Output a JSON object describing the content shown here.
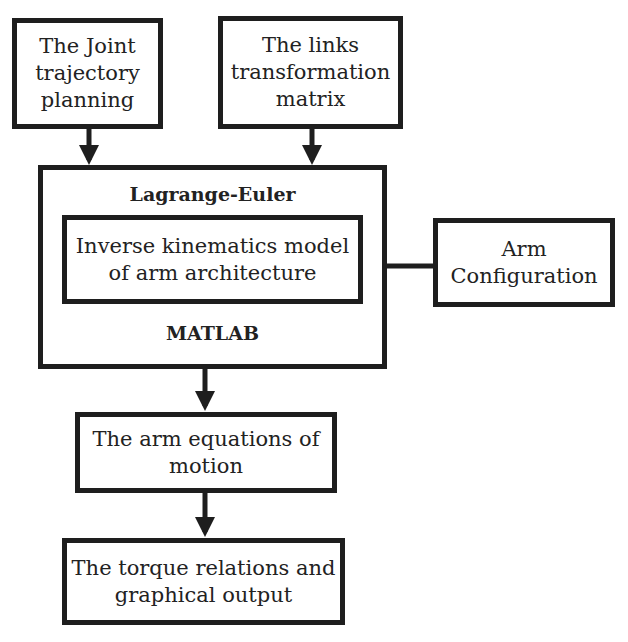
{
  "diagram": {
    "nodes": {
      "joint_trajectory": {
        "lines": [
          "The Joint",
          "trajectory",
          "planning"
        ]
      },
      "links_transformation": {
        "lines": [
          "The links",
          "transformation",
          "matrix"
        ]
      },
      "lagrange_euler": {
        "title": "Lagrange-Euler",
        "footer": "MATLAB"
      },
      "inverse_kinematics": {
        "lines": [
          "Inverse kinematics model",
          "of arm architecture"
        ]
      },
      "arm_configuration": {
        "lines": [
          "Arm",
          "Configuration"
        ]
      },
      "equations_of_motion": {
        "lines": [
          "The arm equations of",
          "motion"
        ]
      },
      "torque_relations": {
        "lines": [
          "The torque relations and",
          "graphical output"
        ]
      }
    },
    "edges": [
      {
        "from": "joint_trajectory",
        "to": "lagrange_euler"
      },
      {
        "from": "links_transformation",
        "to": "lagrange_euler"
      },
      {
        "from": "arm_configuration",
        "to": "inverse_kinematics"
      },
      {
        "from": "lagrange_euler",
        "to": "equations_of_motion"
      },
      {
        "from": "equations_of_motion",
        "to": "torque_relations"
      }
    ],
    "colors": {
      "stroke": "#1e1e1e",
      "background": "#ffffff"
    }
  }
}
